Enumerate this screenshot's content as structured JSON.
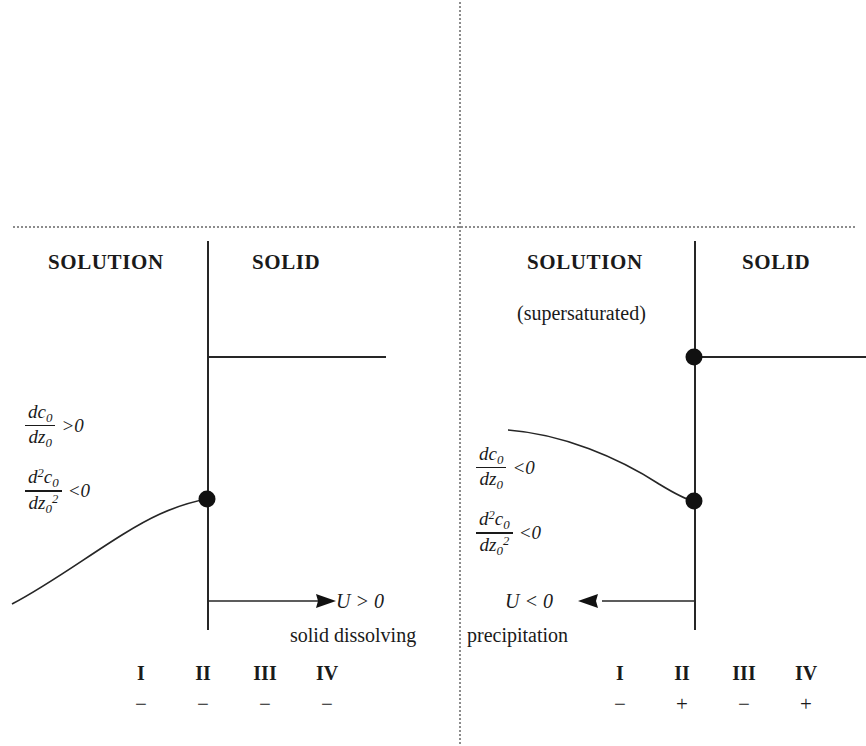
{
  "figure": {
    "type": "diagram",
    "panels": [
      {
        "id": "left",
        "name": "solid-dissolving",
        "phase_left_label": "SOLUTION",
        "phase_right_label": "SOLID",
        "subtitle": "",
        "gradient": {
          "first_derivative": {
            "numerator": "dc",
            "num_sub": "0",
            "denominator": "dz",
            "den_sub": "0",
            "relation": ">0"
          },
          "second_derivative": {
            "numerator": "d",
            "num_sup": "2",
            "num_var": "c",
            "num_sub": "0",
            "denominator": "dz",
            "den_sub": "0",
            "den_sup": "2",
            "relation": "<0"
          }
        },
        "velocity_label": "U > 0",
        "process_caption": "solid dissolving",
        "arrow_direction": "right",
        "columns": [
          "I",
          "II",
          "III",
          "IV"
        ],
        "signs": [
          "−",
          "−",
          "−",
          "−"
        ]
      },
      {
        "id": "right",
        "name": "precipitation",
        "phase_left_label": "SOLUTION",
        "phase_right_label": "SOLID",
        "subtitle": "(supersaturated)",
        "gradient": {
          "first_derivative": {
            "numerator": "dc",
            "num_sub": "0",
            "denominator": "dz",
            "den_sub": "0",
            "relation": "<0"
          },
          "second_derivative": {
            "numerator": "d",
            "num_sup": "2",
            "num_var": "c",
            "num_sub": "0",
            "denominator": "dz",
            "den_sub": "0",
            "den_sup": "2",
            "relation": "<0"
          }
        },
        "velocity_label": "U < 0",
        "process_caption": "precipitation",
        "arrow_direction": "left",
        "columns": [
          "I",
          "II",
          "III",
          "IV"
        ],
        "signs": [
          "−",
          "+",
          "−",
          "+"
        ]
      }
    ],
    "colors": {
      "ink": "#262626",
      "dotted_guide": "#8c8c8c",
      "background": "#ffffff"
    }
  }
}
